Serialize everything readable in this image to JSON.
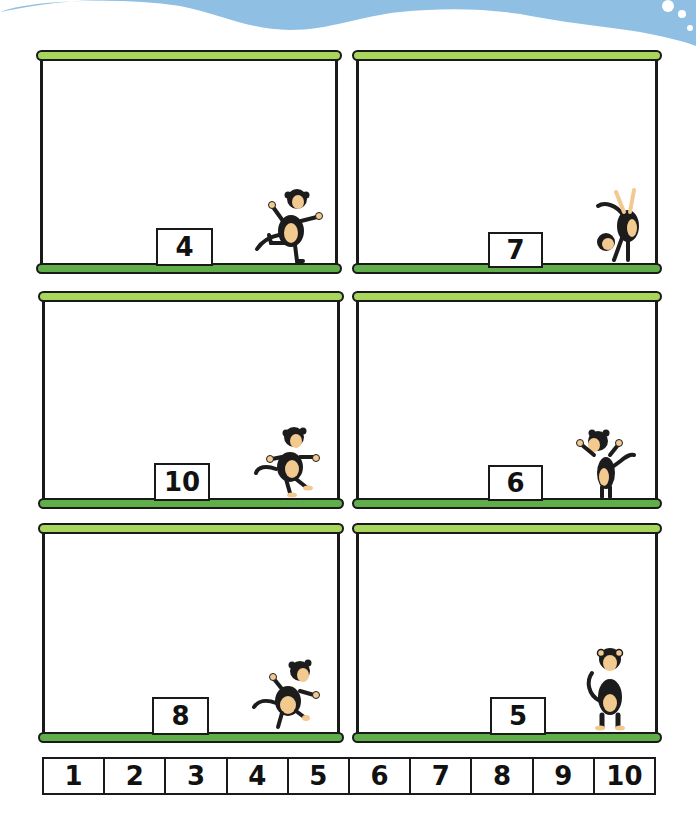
{
  "colors": {
    "water": "#8fbfe3",
    "bar_top": "#a8d65c",
    "bar_bottom": "#5fae4a",
    "outline": "#1a1a1a",
    "monkey_fur": "#1c1c1c",
    "monkey_skin": "#f2c98e"
  },
  "panels": [
    {
      "label": "4",
      "monkey_pose": "dancing"
    },
    {
      "label": "7",
      "monkey_pose": "handstand"
    },
    {
      "label": "10",
      "monkey_pose": "running"
    },
    {
      "label": "6",
      "monkey_pose": "waving"
    },
    {
      "label": "8",
      "monkey_pose": "skipping"
    },
    {
      "label": "5",
      "monkey_pose": "standing"
    }
  ],
  "number_line": [
    "1",
    "2",
    "3",
    "4",
    "5",
    "6",
    "7",
    "8",
    "9",
    "10"
  ]
}
